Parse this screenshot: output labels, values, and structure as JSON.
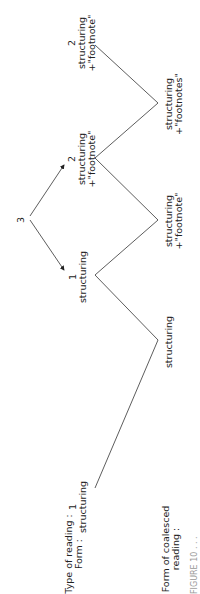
{
  "row_labels": {
    "type_of_reading": "Type of reading :",
    "form": "Form :",
    "coalesced_1": "Form of coalesced",
    "coalesced_2": "reading :"
  },
  "top_nodes": [
    {
      "num": "1",
      "line1": "structuring",
      "line2": ""
    },
    {
      "num": "1",
      "line1": "structuring",
      "line2": ""
    },
    {
      "num": "2",
      "line1": "structuring",
      "line2": "+\"footnote\""
    },
    {
      "num": "2",
      "line1": "structuring",
      "line2": "+\"footnote\""
    }
  ],
  "bottom_nodes": [
    {
      "line1": "structuring",
      "line2": ""
    },
    {
      "line1": "structuring",
      "line2": "+\"footnote\""
    },
    {
      "line1": "structuring",
      "line2": "+\"footnotes\""
    }
  ],
  "branch_label": "3",
  "caption": "FIGURE 10 . . ."
}
